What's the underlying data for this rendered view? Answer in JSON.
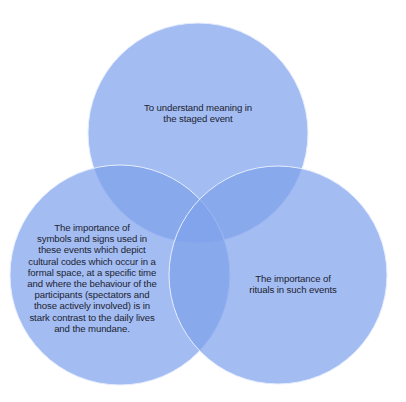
{
  "diagram": {
    "type": "venn",
    "circle_color": "#7fa2ec",
    "circle_opacity": 0.72,
    "stroke_color": "#e6eeff",
    "circles": [
      {
        "id": "top",
        "cx": 198,
        "cy": 133,
        "r": 110,
        "label_lines": [
          "To understand meaning in",
          "the staged event"
        ]
      },
      {
        "id": "left",
        "cx": 120,
        "cy": 275,
        "r": 110,
        "label_lines": [
          "The importance of",
          "symbols and signs used in",
          "these events which depict",
          "cultural codes which occur in a",
          "formal space, at a specific time",
          "and where the behaviour of the",
          "participants (spectators and",
          "those actively involved) is in",
          "stark contrast to the daily lives",
          "and the mundane."
        ]
      },
      {
        "id": "right",
        "cx": 278,
        "cy": 275,
        "r": 109,
        "label_lines": [
          "The importance of",
          "rituals in such events"
        ]
      }
    ]
  }
}
